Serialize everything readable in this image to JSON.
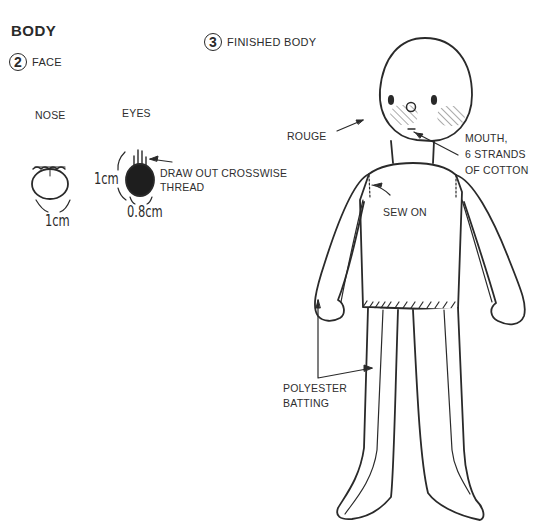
{
  "title": "BODY",
  "steps": [
    {
      "number": "2",
      "label": "FACE"
    },
    {
      "number": "3",
      "label": "FINISHED BODY"
    }
  ],
  "face": {
    "nose_label": "NOSE",
    "eyes_label": "EYES",
    "nose_size": "1cm",
    "eye_height": "1cm",
    "eye_width": "0.8cm",
    "eye_note_line1": "DRAW OUT CROSSWISE",
    "eye_note_line2": "THREAD"
  },
  "finished_body": {
    "rouge": "ROUGE",
    "mouth_line1": "MOUTH,",
    "mouth_line2": "6 STRANDS",
    "mouth_line3": "OF COTTON",
    "sew_on": "SEW ON",
    "batting_line1": "POLYESTER",
    "batting_line2": "BATTING"
  },
  "colors": {
    "ink": "#2a2a2a",
    "background": "#ffffff"
  }
}
